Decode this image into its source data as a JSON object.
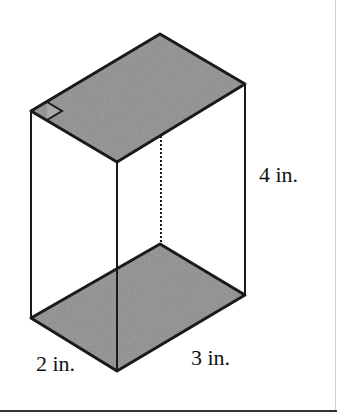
{
  "diagram": {
    "type": "rectangular-prism",
    "faces_shaded": [
      "top",
      "bottom"
    ],
    "colors": {
      "face_fill": "#8e8e8e",
      "edge": "#1a1a1a",
      "background": "#ffffff"
    },
    "labels": {
      "height": "4 in.",
      "width": "2 in.",
      "length": "3 in."
    },
    "right_angle_marker": true,
    "hidden_edge": "dotted vertical back edge"
  }
}
